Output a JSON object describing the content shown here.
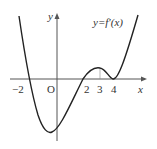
{
  "diagram": {
    "curve_label": "y=f′(x)",
    "axes": {
      "x_label": "x",
      "y_label": "y",
      "origin_label": "O"
    },
    "x_ticks": [
      "−2",
      "2",
      "3",
      "4"
    ],
    "features": {
      "zeros": [
        -2,
        2,
        4
      ],
      "local_max_at": 3,
      "double_root_at": 4,
      "minimum_between": [
        -2,
        0
      ]
    },
    "colors": {
      "curve": "#222222",
      "axis": "#555555"
    }
  }
}
